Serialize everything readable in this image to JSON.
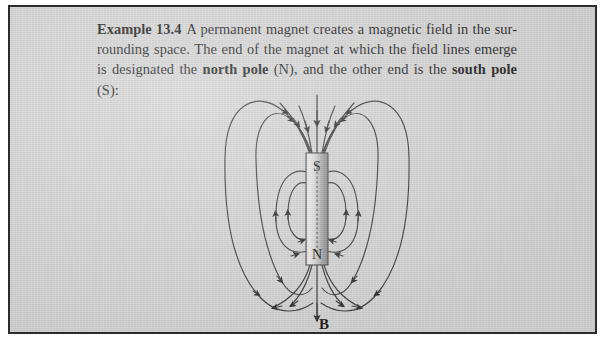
{
  "figure": {
    "caption": {
      "label": "Example 13.4",
      "line1_rest": "A permanent magnet creates a magnetic field in the sur-",
      "line2_a": "rounding space. The end of the magnet at which the field lines emerge is",
      "line3_a": "designated the ",
      "line3_bold1": "north pole",
      "line3_b": " (N), and the other end is the ",
      "line3_bold2": "south pole",
      "line3_c": " (S):"
    },
    "diagram": {
      "type": "bar-magnet-field-lines",
      "magnet_top_pole_label": "S",
      "magnet_bottom_pole_label": "N",
      "field_vector_label": "B",
      "magnet": {
        "x": 296,
        "y": 146,
        "width": 22,
        "height": 112,
        "fill_light": "#e8e8e8",
        "fill_mid": "#b8b8b8",
        "fill_dark": "#8f8f8f",
        "border_color": "#4a4a4a",
        "center_dotted_line": true
      },
      "line_color": "#3a3a3a",
      "loops": [
        {
          "name": "outer-left",
          "side": "left",
          "half_width": 90,
          "top_y": 98,
          "bottom_y": 308
        },
        {
          "name": "outer-right",
          "side": "right",
          "half_width": 90,
          "top_y": 98,
          "bottom_y": 308
        },
        {
          "name": "mid-left",
          "side": "left",
          "half_width": 52,
          "top_y": 108,
          "bottom_y": 298
        },
        {
          "name": "mid-right",
          "side": "right",
          "half_width": 52,
          "top_y": 108,
          "bottom_y": 298
        },
        {
          "name": "inner-left-outer-ring",
          "side": "left",
          "half_width": 34,
          "top_y": 163,
          "bottom_y": 246
        },
        {
          "name": "inner-left-inner-ring",
          "side": "left",
          "half_width": 20,
          "top_y": 175,
          "bottom_y": 234
        },
        {
          "name": "inner-right-outer-ring",
          "side": "right",
          "half_width": 34,
          "top_y": 163,
          "bottom_y": 246
        },
        {
          "name": "inner-right-inner-ring",
          "side": "right",
          "half_width": 20,
          "top_y": 175,
          "bottom_y": 234
        }
      ],
      "axis_line": {
        "x": 307,
        "top_y": 88,
        "bottom_y": 316,
        "arrow_direction": "down"
      }
    }
  },
  "colors": {
    "paper": "#d6d6d6",
    "border": "#2c2c2c",
    "ink": "#1c1c1c",
    "line": "#3a3a3a"
  }
}
